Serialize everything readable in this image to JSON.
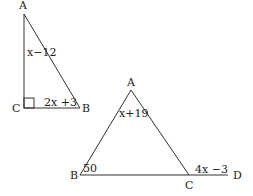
{
  "figure1": {
    "vertices": {
      "A": "A",
      "B": "B",
      "C": "C"
    },
    "side_AC_label": "x−12",
    "side_CB_label": "2x +3",
    "right_angle_at": "C"
  },
  "figure2": {
    "vertices": {
      "A": "A",
      "B": "B",
      "C": "C",
      "D": "D"
    },
    "angle_A_label": "x+19",
    "angle_B_label": "50",
    "exterior_angle_C_label": "4x −3"
  },
  "colors": {
    "line": "#333333",
    "text": "#222222",
    "background": "#ffffff"
  }
}
